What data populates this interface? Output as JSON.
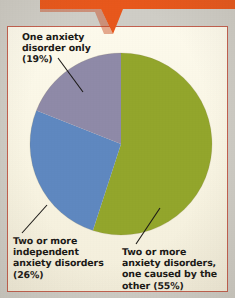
{
  "figure": {
    "kind": "pie-chart-clipping",
    "paper_color": "#faf6e6",
    "panel_border_color": "#c2604f",
    "banner_color": "#e8581c",
    "page_background": "#cfcdc6",
    "text_color": "#1c1a17",
    "leader_line_color": "#1c1a17"
  },
  "chart_data": {
    "type": "pie",
    "title": "",
    "subtitle": "",
    "xlabel": "",
    "ylabel": "",
    "legend_position": "callout-labels",
    "grid": false,
    "start_angle_deg": 0,
    "direction": "clockwise",
    "categories": [
      "Two or more anxiety disorders, one caused by the other",
      "Two or more independent anxiety disorders",
      "One anxiety disorder only"
    ],
    "values": [
      55,
      26,
      19
    ],
    "value_unit": "percent",
    "colors": [
      "#93a62c",
      "#5f88c0",
      "#8f8aa8"
    ],
    "slices": [
      {
        "label": "Two or more anxiety disorders, one caused by the other",
        "value": 55,
        "display": "(55%)",
        "color": "#93a62c"
      },
      {
        "label": "Two or more independent anxiety disorders",
        "value": 26,
        "display": "(26%)",
        "color": "#5f88c0"
      },
      {
        "label": "One anxiety disorder only",
        "value": 19,
        "display": "(19%)",
        "color": "#8f8aa8"
      }
    ]
  },
  "labels": {
    "one_disorder": "One anxiety\ndisorder only\n(19%)",
    "two_independent": "Two or more\nindependent\nanxiety disorders\n(26%)",
    "two_caused": "Two or more\nanxiety disorders,\none caused by the\nother (55%)"
  }
}
